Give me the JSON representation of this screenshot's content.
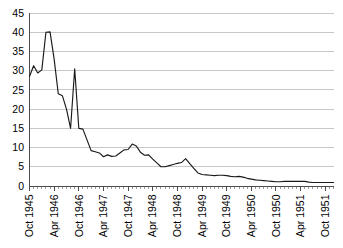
{
  "chart_data": {
    "type": "line",
    "title": "",
    "subtitle": "",
    "xlabel": "",
    "ylabel": "",
    "grid": "horizontal",
    "legend": "none",
    "ylim": [
      0,
      45
    ],
    "ytick_step": 5,
    "ytick_labels": [
      "0",
      "5",
      "10",
      "15",
      "20",
      "25",
      "30",
      "35",
      "40",
      "45"
    ],
    "ytick_values": [
      0,
      5,
      10,
      15,
      20,
      25,
      30,
      35,
      40,
      45
    ],
    "xtick_labels": [
      "Oct 1945",
      "Apr 1946",
      "Oct 1946",
      "Apr 1947",
      "Oct 1947",
      "Apr 1948",
      "Oct 1948",
      "Apr 1949",
      "Oct 1949",
      "Apr 1950",
      "Oct 1950",
      "Apr 1951",
      "Oct 1951"
    ],
    "xtick_label_rotation": -90,
    "x_minor_tick_interval": "1 month",
    "x_major_tick_interval": "6 months",
    "x": [
      "Oct 1945",
      "Nov 1945",
      "Dec 1945",
      "Jan 1946",
      "Feb 1946",
      "Mar 1946",
      "Apr 1946",
      "May 1946",
      "Jun 1946",
      "Jul 1946",
      "Aug 1946",
      "Sep 1946",
      "Oct 1946",
      "Nov 1946",
      "Dec 1946",
      "Jan 1947",
      "Feb 1947",
      "Mar 1947",
      "Apr 1947",
      "May 1947",
      "Jun 1947",
      "Jul 1947",
      "Aug 1947",
      "Sep 1947",
      "Oct 1947",
      "Nov 1947",
      "Dec 1947",
      "Jan 1948",
      "Feb 1948",
      "Mar 1948",
      "Apr 1948",
      "May 1948",
      "Jun 1948",
      "Jul 1948",
      "Aug 1948",
      "Sep 1948",
      "Oct 1948",
      "Nov 1948",
      "Dec 1948",
      "Jan 1949",
      "Feb 1949",
      "Mar 1949",
      "Apr 1949",
      "May 1949",
      "Jun 1949",
      "Jul 1949",
      "Aug 1949",
      "Sep 1949",
      "Oct 1949",
      "Nov 1949",
      "Dec 1949",
      "Jan 1950",
      "Feb 1950",
      "Mar 1950",
      "Apr 1950",
      "May 1950",
      "Jun 1950",
      "Jul 1950",
      "Aug 1950",
      "Sep 1950",
      "Oct 1950",
      "Nov 1950",
      "Dec 1950",
      "Jan 1951",
      "Feb 1951",
      "Mar 1951",
      "Apr 1951",
      "May 1951",
      "Jun 1951",
      "Jul 1951",
      "Aug 1951",
      "Sep 1951",
      "Oct 1951",
      "Nov 1951",
      "Dec 1951"
    ],
    "values": [
      28.5,
      31.3,
      29.4,
      30.2,
      40.0,
      40.1,
      33.0,
      24.0,
      23.5,
      20.0,
      15.0,
      30.5,
      15.0,
      14.8,
      12.0,
      9.2,
      8.9,
      8.6,
      7.6,
      8.1,
      7.7,
      7.8,
      8.6,
      9.4,
      9.5,
      10.9,
      10.4,
      8.8,
      8.0,
      8.1,
      7.0,
      6.0,
      5.0,
      5.0,
      5.3,
      5.6,
      5.9,
      6.1,
      7.1,
      5.8,
      4.6,
      3.4,
      3.0,
      2.9,
      2.8,
      2.7,
      2.8,
      2.8,
      2.7,
      2.5,
      2.4,
      2.5,
      2.3,
      2.0,
      1.8,
      1.6,
      1.5,
      1.4,
      1.3,
      1.2,
      1.1,
      1.1,
      1.2,
      1.2,
      1.2,
      1.2,
      1.2,
      1.2,
      1.0,
      0.9,
      0.9,
      0.9,
      0.9,
      0.9,
      0.9
    ],
    "colors": {
      "line": "#1a1a1a",
      "grid": "#b9b9b9",
      "axis": "#4d4d4d",
      "background": "#ffffff",
      "text": "#000000"
    }
  }
}
